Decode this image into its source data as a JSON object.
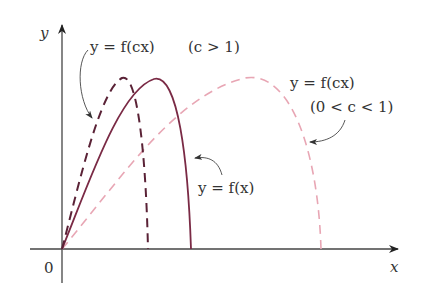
{
  "diagram": {
    "axes": {
      "x_label": "x",
      "y_label": "y",
      "origin_label": "0"
    },
    "curves": [
      {
        "name": "original",
        "equation": "y = f(x)",
        "style": "solid",
        "color": "#7a2a45"
      },
      {
        "name": "compressed",
        "equation": "y = f(cx)",
        "condition": "(c > 1)",
        "style": "dashed-dark",
        "color": "#5a2236"
      },
      {
        "name": "stretched",
        "equation": "y = f(cx)",
        "condition": "(0 < c < 1)",
        "style": "dashed-light",
        "color": "#e8a6b4"
      }
    ],
    "labels": {
      "compressed_eq": "y = f(cx)",
      "compressed_cond": "(c > 1)",
      "stretched_eq": "y = f(cx)",
      "stretched_cond": "(0 < c < 1)",
      "original_eq": "y = f(x)"
    }
  }
}
